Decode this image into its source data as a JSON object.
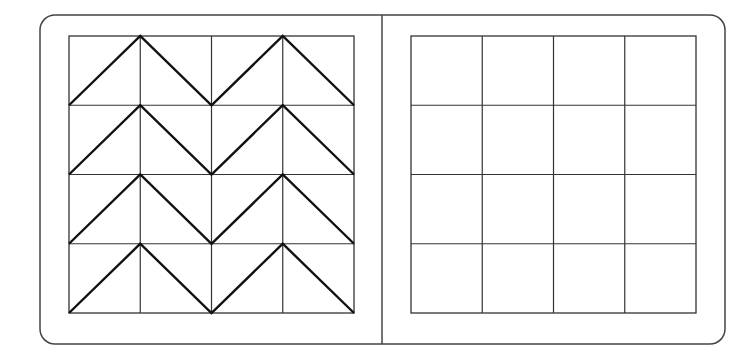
{
  "canvas": {
    "width": 756,
    "height": 359,
    "background": "#ffffff"
  },
  "frame": {
    "x": 40,
    "y": 15,
    "width": 685,
    "height": 329,
    "radius": 15,
    "stroke": "#444444",
    "divider_x": 382
  },
  "left_panel": {
    "grid": {
      "x": 69,
      "y": 36,
      "width": 285,
      "height": 277,
      "rows": 4,
      "cols": 4,
      "stroke": "#333333"
    },
    "pattern": "chevron",
    "chevron_stroke": "#111111",
    "description": "4x4 grid with diagonal zigzag (chevron) lines peaking at column lines 1 and 3 on each row"
  },
  "right_panel": {
    "grid": {
      "x": 411,
      "y": 36,
      "width": 285,
      "height": 277,
      "rows": 4,
      "cols": 4,
      "stroke": "#333333"
    },
    "pattern": "empty"
  }
}
